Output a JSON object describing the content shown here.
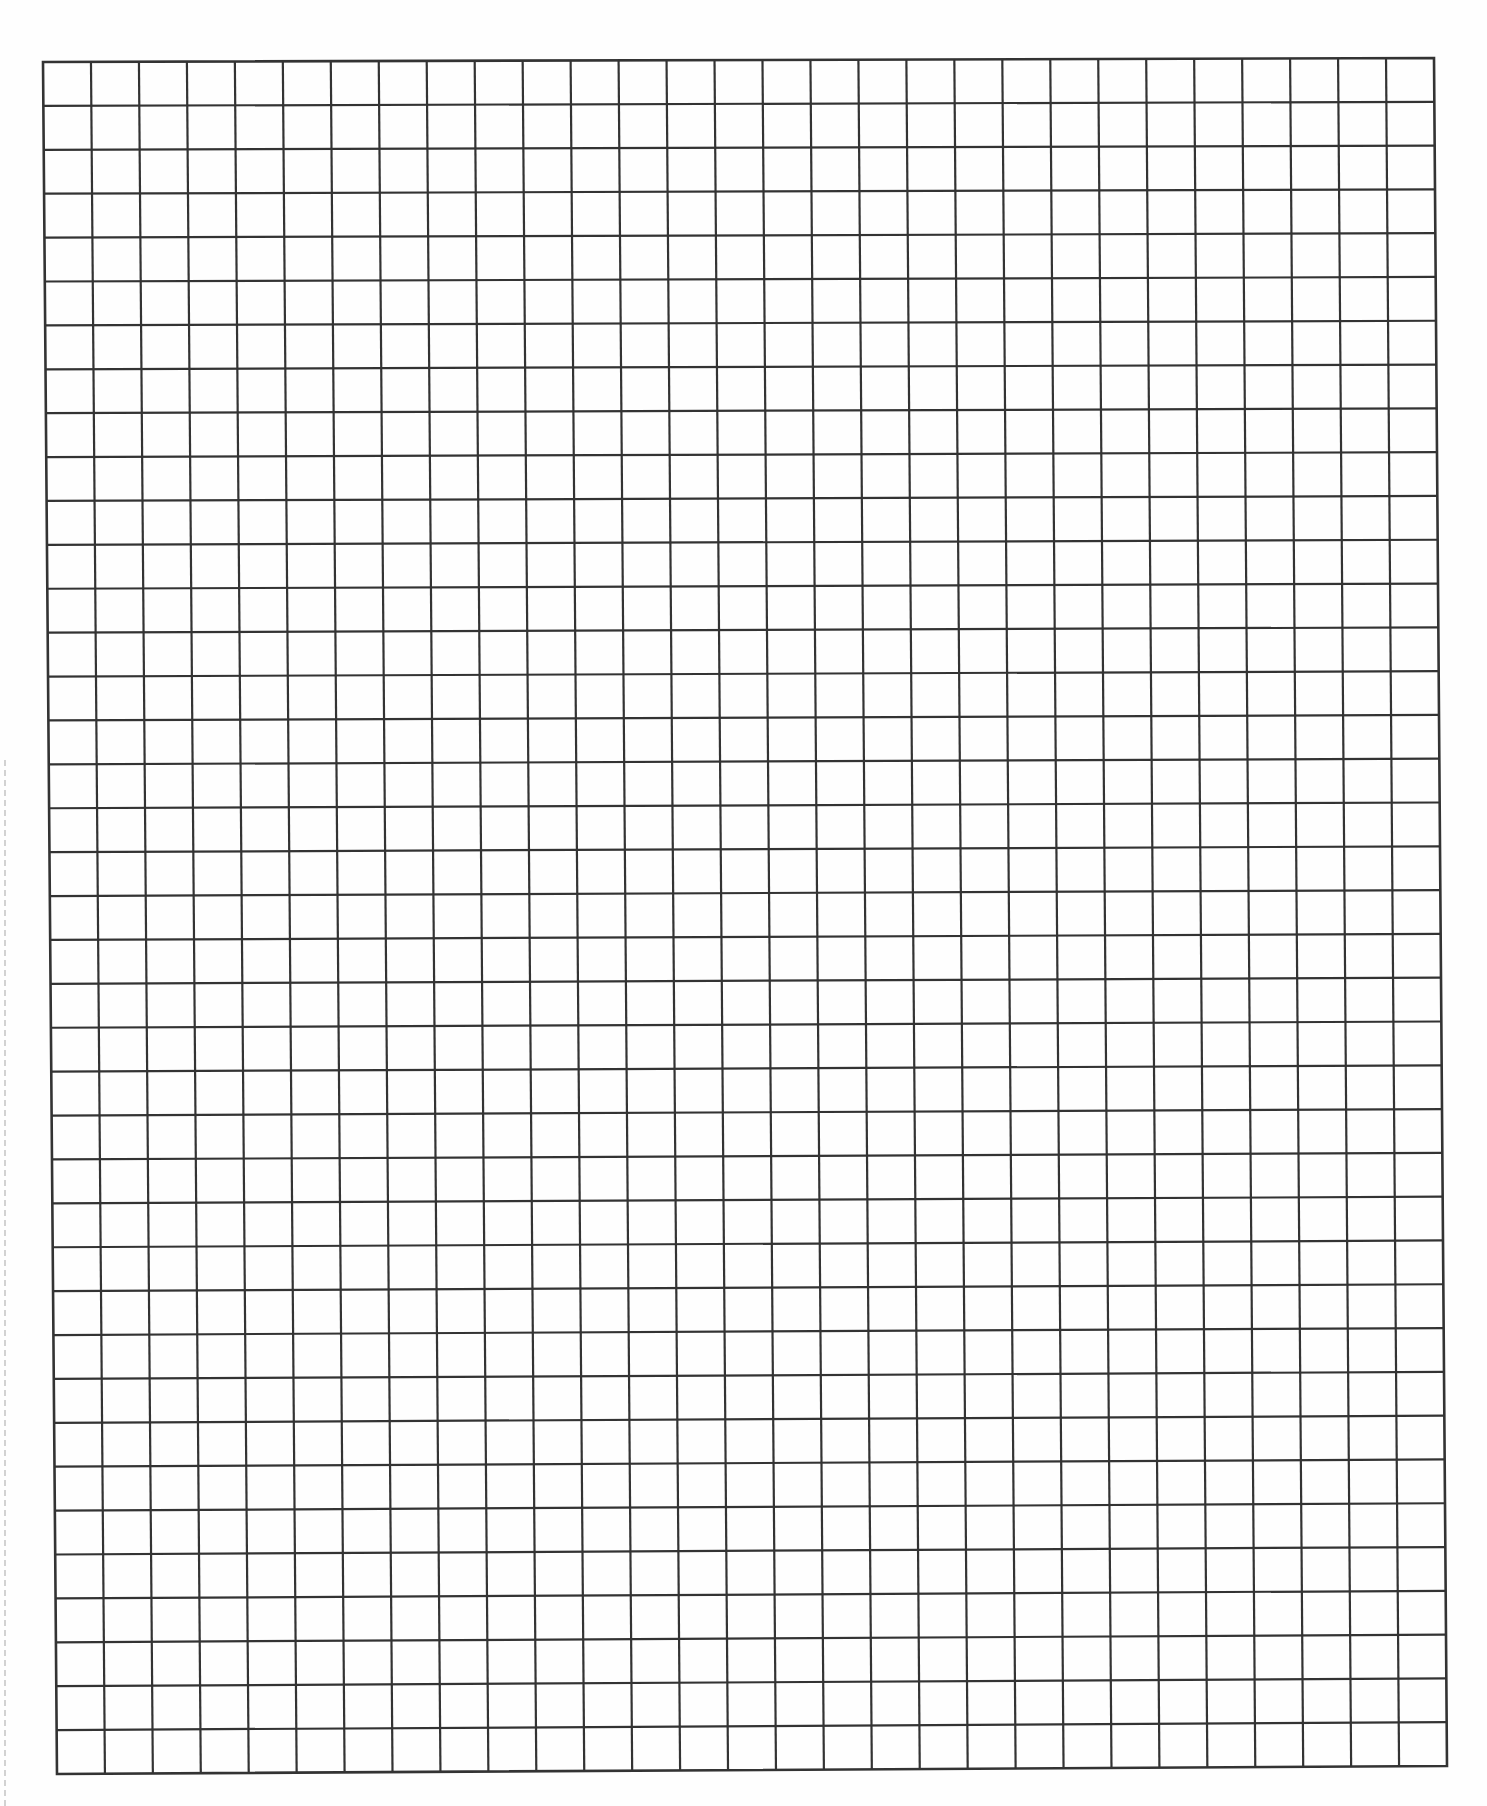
{
  "page": {
    "width": 1487,
    "height": 1806,
    "background": "#fefefe"
  },
  "grid": {
    "columns": 29,
    "rows": 39,
    "line_color": "#333333",
    "line_width": 2.2,
    "border_width": 2.6,
    "corners": {
      "top_left": [
        43,
        62
      ],
      "top_right": [
        1434,
        58
      ],
      "bottom_left": [
        57,
        1774
      ],
      "bottom_right": [
        1447,
        1766
      ]
    }
  },
  "perforation": {
    "x": 4,
    "top": 760,
    "bottom": 1806,
    "color": "#c8c8c8"
  }
}
